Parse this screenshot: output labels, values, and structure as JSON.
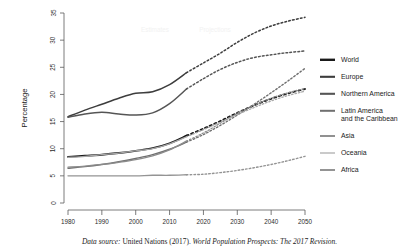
{
  "chart_data": {
    "type": "line",
    "title": "",
    "xlabel": "",
    "ylabel": "Percentage",
    "xlim": [
      1980,
      2050
    ],
    "ylim": [
      0,
      35
    ],
    "xticks": [
      1980,
      1990,
      2000,
      2010,
      2020,
      2030,
      2040,
      2050
    ],
    "yticks": [
      0,
      5,
      10,
      15,
      20,
      25,
      30,
      35
    ],
    "grid": false,
    "legend_position": "right",
    "annotations": [
      "Estimates",
      "Projections"
    ],
    "estimates_range": [
      1980,
      2015
    ],
    "projections_range": [
      2015,
      2050
    ],
    "series": [
      {
        "name": "World",
        "color": "#1a1a1a",
        "width": 1.9,
        "x": [
          1980,
          1985,
          1990,
          1995,
          2000,
          2005,
          2010,
          2015,
          2020,
          2025,
          2030,
          2035,
          2040,
          2045,
          2050
        ],
        "values": [
          8.5,
          8.7,
          8.9,
          9.2,
          9.6,
          10.1,
          11.0,
          12.4,
          13.7,
          15.1,
          16.6,
          18.0,
          19.2,
          20.2,
          21.0
        ]
      },
      {
        "name": "Europe",
        "color": "#3d3d3d",
        "width": 1.5,
        "x": [
          1980,
          1985,
          1990,
          1995,
          2000,
          2005,
          2010,
          2015,
          2020,
          2025,
          2030,
          2035,
          2040,
          2045,
          2050
        ],
        "values": [
          15.9,
          17.1,
          18.2,
          19.3,
          20.2,
          20.5,
          21.8,
          24.0,
          25.8,
          27.6,
          29.6,
          31.3,
          32.6,
          33.5,
          34.2
        ]
      },
      {
        "name": "Northern America",
        "color": "#555555",
        "width": 1.5,
        "x": [
          1980,
          1985,
          1990,
          1995,
          2000,
          2005,
          2010,
          2015,
          2020,
          2025,
          2030,
          2035,
          2040,
          2045,
          2050
        ],
        "values": [
          15.8,
          16.4,
          16.7,
          16.4,
          16.2,
          16.6,
          18.3,
          21.0,
          22.9,
          24.6,
          25.9,
          26.8,
          27.3,
          27.7,
          28.0
        ]
      },
      {
        "name": "Latin America and the Caribbean",
        "color": "#707070",
        "width": 1.4,
        "x": [
          1980,
          1985,
          1990,
          1995,
          2000,
          2005,
          2010,
          2015,
          2020,
          2025,
          2030,
          2035,
          2040,
          2045,
          2050
        ],
        "values": [
          6.4,
          6.7,
          7.1,
          7.6,
          8.2,
          8.9,
          9.9,
          11.2,
          12.6,
          14.3,
          16.2,
          18.2,
          20.3,
          22.5,
          24.8
        ]
      },
      {
        "name": "Asia",
        "color": "#8c8c8c",
        "width": 1.3,
        "x": [
          1980,
          1985,
          1990,
          1995,
          2000,
          2005,
          2010,
          2015,
          2020,
          2025,
          2030,
          2035,
          2040,
          2045,
          2050
        ],
        "values": [
          6.6,
          6.8,
          7.1,
          7.5,
          8.0,
          8.7,
          9.8,
          11.4,
          12.9,
          14.7,
          16.5,
          18.0,
          19.3,
          20.3,
          21.1
        ]
      },
      {
        "name": "Oceania",
        "color": "#a8a8a8",
        "width": 1.3,
        "x": [
          1980,
          1985,
          1990,
          1995,
          2000,
          2005,
          2010,
          2015,
          2020,
          2025,
          2030,
          2035,
          2040,
          2045,
          2050
        ],
        "values": [
          8.4,
          8.6,
          8.9,
          9.2,
          9.6,
          10.0,
          10.9,
          12.2,
          13.5,
          14.9,
          16.3,
          17.6,
          18.8,
          19.8,
          20.6
        ]
      },
      {
        "name": "Africa",
        "color": "#949494",
        "width": 1.4,
        "x": [
          1980,
          1985,
          1990,
          1995,
          2000,
          2005,
          2010,
          2015,
          2020,
          2025,
          2030,
          2035,
          2040,
          2045,
          2050
        ],
        "values": [
          5.0,
          5.0,
          5.0,
          5.0,
          5.0,
          5.1,
          5.1,
          5.2,
          5.3,
          5.6,
          6.0,
          6.5,
          7.1,
          7.8,
          8.6
        ]
      }
    ]
  },
  "legend": {
    "items": [
      {
        "label": "World",
        "color": "#1a1a1a",
        "width": 2.4,
        "dashed": false
      },
      {
        "label": "Europe",
        "color": "#3d3d3d",
        "width": 2.1,
        "dashed": false
      },
      {
        "label": "Northern America",
        "color": "#555555",
        "width": 2.1,
        "dashed": false
      },
      {
        "label": "Latin America\nand the Caribbean",
        "color": "#707070",
        "width": 2.0,
        "dashed": false
      },
      {
        "label": "Asia",
        "color": "#8c8c8c",
        "width": 1.9,
        "dashed": false
      },
      {
        "label": "Oceania",
        "color": "#c4c4c4",
        "width": 1.8,
        "dashed": false
      },
      {
        "label": "Africa",
        "color": "#949494",
        "width": 2.0,
        "dashed": false
      }
    ]
  },
  "caption": {
    "source_label": "Data source:",
    "body": " United Nations (2017). ",
    "work_title": "World Population Prospects: The 2017 Revision."
  }
}
